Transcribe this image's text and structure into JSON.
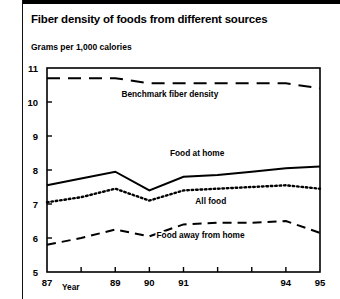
{
  "chart_data": {
    "type": "line",
    "title": "Fiber density of foods from different sources",
    "subtitle": "Grams per 1,000 calories",
    "ylabel": "Grams per 1,000 calories",
    "xlabel": "Year",
    "ylim": [
      5,
      11
    ],
    "yticks": [
      5,
      6,
      7,
      8,
      9,
      10,
      11
    ],
    "ytick_labels": [
      "5",
      "6",
      "7",
      "8",
      "9",
      "10",
      "11"
    ],
    "x": [
      87,
      88,
      89,
      90,
      91,
      92,
      93,
      94,
      95
    ],
    "categories": [
      "87",
      "88",
      "89",
      "90",
      "91",
      "92",
      "93",
      "94",
      "95"
    ],
    "xtick_labels_visible": [
      "87",
      "",
      "89",
      "90",
      "91",
      "",
      "",
      "94",
      "95"
    ],
    "grid": false,
    "legend": "inline-labels",
    "series": [
      {
        "name": "Benchmark fiber density",
        "style": "long-dash",
        "values": [
          10.7,
          10.7,
          10.7,
          10.55,
          10.55,
          10.55,
          10.55,
          10.55,
          10.4
        ],
        "label_x": 90.6,
        "label_y": 10.15
      },
      {
        "name": "Food at home",
        "style": "solid",
        "values": [
          7.55,
          7.75,
          7.95,
          7.4,
          7.8,
          7.85,
          7.95,
          8.05,
          8.1
        ],
        "label_x": 91.4,
        "label_y": 8.4
      },
      {
        "name": "All food",
        "style": "dotted",
        "values": [
          7.05,
          7.2,
          7.45,
          7.1,
          7.4,
          7.45,
          7.5,
          7.55,
          7.45
        ],
        "label_x": 91.8,
        "label_y": 7.0
      },
      {
        "name": "Food away from home",
        "style": "dash",
        "values": [
          5.8,
          6.0,
          6.25,
          6.05,
          6.4,
          6.45,
          6.45,
          6.5,
          6.15
        ],
        "label_x": 91.5,
        "label_y": 6.0
      }
    ]
  }
}
